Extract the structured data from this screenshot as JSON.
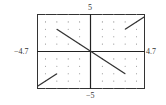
{
  "chart_data": {
    "type": "line",
    "title": "",
    "xlabel": "",
    "ylabel": "",
    "window": {
      "xmin": -4.7,
      "xmax": 4.7,
      "ymin": -5,
      "ymax": 5
    },
    "xlim": [
      -4.7,
      4.7
    ],
    "ylim": [
      -5,
      5
    ],
    "grid": "dots at integer points",
    "tick_labels": {
      "ymax": "5",
      "ymin": "−5",
      "xmin": "−4.7",
      "xmax": "4.7"
    },
    "series": [
      {
        "name": "left piece (y = x, x < -3)",
        "points": [
          [
            -4.7,
            -4.7
          ],
          [
            -3,
            -3
          ]
        ]
      },
      {
        "name": "middle piece (y = -x, -3 ≤ x ≤ 3)",
        "points": [
          [
            -3,
            3
          ],
          [
            3,
            -3
          ]
        ]
      },
      {
        "name": "right piece (y = x, x > 3)",
        "points": [
          [
            3,
            3
          ],
          [
            4.7,
            4.7
          ]
        ]
      }
    ],
    "colors": {
      "curve": "#333333",
      "axes": "#222222",
      "frame": "#333333",
      "grid": "#888888"
    }
  }
}
